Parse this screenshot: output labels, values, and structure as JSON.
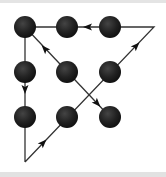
{
  "diagram": {
    "colors": {
      "dot": "#1e1e1e",
      "dot_highlight": "#3a3a3a",
      "line": "#333333",
      "background": "#ffffff",
      "border": "#e3e3e3"
    },
    "dots": [
      {
        "id": "r1c1",
        "x": 25,
        "y": 27
      },
      {
        "id": "r1c2",
        "x": 67,
        "y": 27
      },
      {
        "id": "r1c3",
        "x": 110,
        "y": 27
      },
      {
        "id": "r2c1",
        "x": 25,
        "y": 72
      },
      {
        "id": "r2c2",
        "x": 67,
        "y": 72
      },
      {
        "id": "r2c3",
        "x": 110,
        "y": 72
      },
      {
        "id": "r3c1",
        "x": 25,
        "y": 117
      },
      {
        "id": "r3c2",
        "x": 67,
        "y": 117
      },
      {
        "id": "r3c3",
        "x": 110,
        "y": 117
      }
    ],
    "dot_radius": 11,
    "path": [
      {
        "x": 25,
        "y": 162
      },
      {
        "x": 154,
        "y": 27
      },
      {
        "x": 25,
        "y": 27
      },
      {
        "x": 25,
        "y": 162
      }
    ],
    "diagonal": {
      "from": {
        "x": 25,
        "y": 27
      },
      "to": {
        "x": 110,
        "y": 117
      }
    },
    "arrows": [
      {
        "x": 88,
        "y": 27,
        "angle": 180,
        "direction": "left"
      },
      {
        "x": 136,
        "y": 46,
        "angle": -46,
        "direction": "up-right"
      },
      {
        "x": 25,
        "y": 89,
        "angle": 90,
        "direction": "down"
      },
      {
        "x": 43,
        "y": 143,
        "angle": -46,
        "direction": "up-right"
      },
      {
        "x": 45,
        "y": 49,
        "angle": -133,
        "direction": "up-left"
      },
      {
        "x": 97,
        "y": 103,
        "angle": 47,
        "direction": "down-right"
      }
    ]
  }
}
